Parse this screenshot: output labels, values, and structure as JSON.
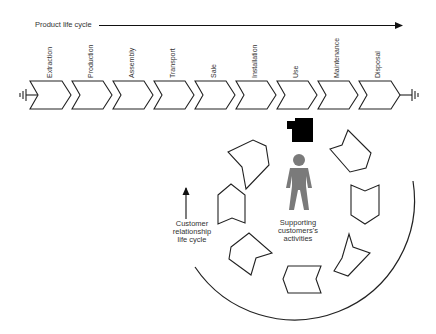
{
  "product_life_cycle": {
    "title": "Product life cycle",
    "stages": [
      {
        "label": "Extraction"
      },
      {
        "label": "Production"
      },
      {
        "label": "Assembly"
      },
      {
        "label": "Transport"
      },
      {
        "label": "Sale"
      },
      {
        "label": "Installation"
      },
      {
        "label": "Use"
      },
      {
        "label": "Maintenance"
      },
      {
        "label": "Disposal"
      }
    ]
  },
  "customer_cycle": {
    "label_line1": "Customer",
    "label_line2": "relationship",
    "label_line3": "life cycle",
    "activity_count": 8
  },
  "center": {
    "label_line1": "Supporting",
    "label_line2": "customers's",
    "label_line3": "activities",
    "icons": [
      "product-box-icon",
      "person-icon"
    ]
  },
  "colors": {
    "stroke": "#222222",
    "person": "#7a7a7a",
    "box": "#000000",
    "text": "#333333"
  }
}
